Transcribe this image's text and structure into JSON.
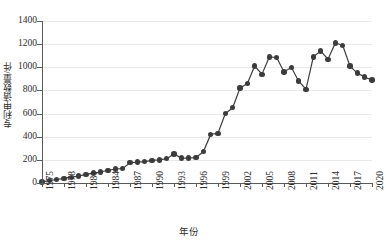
{
  "chart_data": {
    "type": "line",
    "title": "",
    "xlabel": "年份",
    "ylabel": "专利申请数量/件",
    "xlim": [
      1975,
      2020
    ],
    "ylim": [
      0,
      1400
    ],
    "ytick_values": [
      0,
      200,
      400,
      600,
      800,
      1000,
      1200,
      1400
    ],
    "ytick_labels": [
      "0",
      "200",
      "400",
      "600",
      "800",
      "1000",
      "1200",
      "1400"
    ],
    "xtick_values": [
      1975,
      1978,
      1981,
      1984,
      1987,
      1990,
      1993,
      1996,
      1999,
      2002,
      2005,
      2008,
      2011,
      2014,
      2017,
      2020
    ],
    "xtick_labels": [
      "1975",
      "1978",
      "1981",
      "1984",
      "1987",
      "1990",
      "1993",
      "1996",
      "1999",
      "2002",
      "2005",
      "2008",
      "2011",
      "2014",
      "2017",
      "2020"
    ],
    "grid": "horizontal",
    "legend": "none",
    "marker": "filled-circle",
    "series_color": "#3c3c3c",
    "grid_color": "#e9e9e9",
    "axis_color": "#5a5a5a",
    "x": [
      1975,
      1976,
      1977,
      1978,
      1979,
      1980,
      1981,
      1982,
      1983,
      1984,
      1985,
      1986,
      1987,
      1988,
      1989,
      1990,
      1991,
      1992,
      1993,
      1994,
      1995,
      1996,
      1997,
      1998,
      1999,
      2000,
      2001,
      2002,
      2003,
      2004,
      2005,
      2006,
      2007,
      2008,
      2009,
      2010,
      2011,
      2012,
      2013,
      2014,
      2015,
      2016,
      2017,
      2018,
      2019,
      2020
    ],
    "values": [
      10,
      20,
      30,
      40,
      50,
      60,
      75,
      85,
      95,
      110,
      120,
      125,
      175,
      180,
      185,
      195,
      200,
      210,
      250,
      215,
      215,
      220,
      270,
      420,
      430,
      600,
      650,
      820,
      860,
      1010,
      940,
      1090,
      1085,
      960,
      1000,
      880,
      810,
      1090,
      1140,
      1070,
      1210,
      1190,
      1010,
      950,
      915,
      890
    ]
  }
}
